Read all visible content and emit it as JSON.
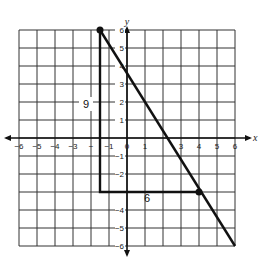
{
  "diagram": {
    "type": "coordinate-plane-right-triangle",
    "grid": {
      "xmin": -6,
      "xmax": 6,
      "ymin": -6,
      "ymax": 6,
      "step": 1
    },
    "axes": {
      "x_label": "x",
      "y_label": "y"
    },
    "x_ticks": [
      "−6",
      "−5",
      "−4",
      "−3",
      "−",
      "−1",
      "0",
      "1",
      "3",
      "4",
      "5",
      "6"
    ],
    "x_tick_values": [
      -6,
      -5,
      -4,
      -3,
      -2,
      -1,
      0,
      1,
      3,
      4,
      5,
      6
    ],
    "y_ticks": [
      "6",
      "5",
      "4",
      "3",
      "2",
      "1",
      "−1",
      "−2",
      "−4",
      "−5",
      "−6"
    ],
    "y_tick_values": [
      6,
      5,
      4,
      3,
      2,
      1,
      -1,
      -2,
      -4,
      -5,
      -6
    ],
    "triangle": {
      "vertices": [
        [
          -1.5,
          6
        ],
        [
          -1.5,
          -3
        ],
        [
          4,
          -3
        ]
      ],
      "vertical_leg_label": "9",
      "horizontal_leg_label": "6"
    },
    "line": {
      "from": [
        -1.5,
        6
      ],
      "to": [
        6,
        -6
      ]
    },
    "points": [
      [
        -1.5,
        6
      ],
      [
        4,
        -3
      ]
    ],
    "colors": {
      "grid": "#333333",
      "line": "#111111",
      "background": "#ffffff"
    }
  }
}
